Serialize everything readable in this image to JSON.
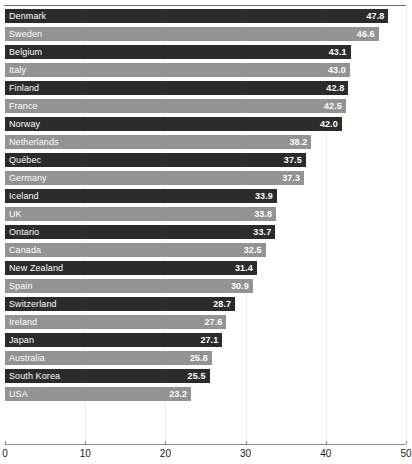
{
  "chart_data": {
    "type": "bar",
    "orientation": "horizontal",
    "title": "",
    "subtitle": "",
    "xlabel": "",
    "ylabel": "",
    "xlim": [
      0,
      50
    ],
    "ticks": [
      0,
      10,
      20,
      30,
      40,
      50
    ],
    "tick_labels": [
      "0",
      "10",
      "20",
      "30",
      "40",
      "50"
    ],
    "grid": "vertical-faint",
    "legend": "none",
    "categories": [
      "Denmark",
      "Sweden",
      "Belgium",
      "Italy",
      "Finland",
      "France",
      "Norway",
      "Netherlands",
      "Québec",
      "Germany",
      "Iceland",
      "UK",
      "Ontario",
      "Canada",
      "New Zealand",
      "Spain",
      "Switzerland",
      "Ireland",
      "Japan",
      "Australia",
      "South Korea",
      "USA"
    ],
    "values": [
      47.8,
      46.6,
      43.1,
      43.0,
      42.8,
      42.5,
      42.0,
      38.2,
      37.5,
      37.3,
      33.9,
      33.8,
      33.7,
      32.5,
      31.4,
      30.9,
      28.7,
      27.6,
      27.1,
      25.8,
      25.5,
      23.2
    ],
    "value_labels": [
      "47.8",
      "46.6",
      "43.1",
      "43.0",
      "42.8",
      "42.5",
      "42.0",
      "38.2",
      "37.5",
      "37.3",
      "33.9",
      "33.8",
      "33.7",
      "32.5",
      "31.4",
      "30.9",
      "28.7",
      "27.6",
      "27.1",
      "25.8",
      "25.5",
      "23.2"
    ],
    "bar_shades": [
      "dark",
      "light",
      "dark",
      "light",
      "dark",
      "light",
      "dark",
      "light",
      "dark",
      "light",
      "dark",
      "light",
      "dark",
      "light",
      "dark",
      "light",
      "dark",
      "light",
      "dark",
      "light",
      "dark",
      "light"
    ],
    "colors": {
      "dark_bar": "#2b2b2b",
      "light_bar": "#939393",
      "bar_text": "#ffffff",
      "axis": "#8a8a8a",
      "gridline": "#ececec",
      "background": "#ffffff",
      "tick_label": "#1a1a1a"
    }
  }
}
